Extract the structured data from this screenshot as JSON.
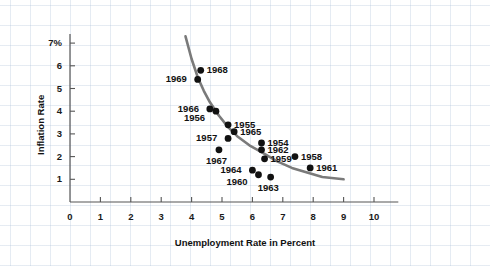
{
  "chart_data": {
    "type": "scatter",
    "title": "",
    "xlabel": "Unemployment Rate in Percent",
    "ylabel": "Inflation Rate",
    "xlim": [
      0,
      10.8
    ],
    "ylim": [
      0,
      7.4
    ],
    "grid": true,
    "legend": null,
    "xticks": [
      "0",
      "1",
      "2",
      "3",
      "4",
      "5",
      "6",
      "7",
      "8",
      "9",
      "10"
    ],
    "xtick_values": [
      0,
      1,
      2,
      3,
      4,
      5,
      6,
      7,
      8,
      9,
      10
    ],
    "yticks": [
      "1",
      "2",
      "3",
      "4",
      "5",
      "6",
      "7%"
    ],
    "ytick_values": [
      1,
      2,
      3,
      4,
      5,
      6,
      7
    ],
    "origin_label": "0",
    "point_color": "#111111",
    "curve_color": "#7a7a7a",
    "points": [
      {
        "label": "1968",
        "x": 4.3,
        "y": 5.8,
        "label_pos": "right"
      },
      {
        "label": "1969",
        "x": 4.2,
        "y": 5.4,
        "label_pos": "left"
      },
      {
        "label": "1966",
        "x": 4.6,
        "y": 4.1,
        "label_pos": "left"
      },
      {
        "label": "1956",
        "x": 4.8,
        "y": 4.0,
        "label_pos": "left-below"
      },
      {
        "label": "1955",
        "x": 5.2,
        "y": 3.4,
        "label_pos": "right"
      },
      {
        "label": "1965",
        "x": 5.4,
        "y": 3.1,
        "label_pos": "right"
      },
      {
        "label": "1957",
        "x": 5.2,
        "y": 2.8,
        "label_pos": "left"
      },
      {
        "label": "1967",
        "x": 4.9,
        "y": 2.3,
        "label_pos": "below"
      },
      {
        "label": "1954",
        "x": 6.3,
        "y": 2.6,
        "label_pos": "right"
      },
      {
        "label": "1962",
        "x": 6.3,
        "y": 2.3,
        "label_pos": "right"
      },
      {
        "label": "1959",
        "x": 6.4,
        "y": 1.9,
        "label_pos": "right"
      },
      {
        "label": "1958",
        "x": 7.4,
        "y": 2.0,
        "label_pos": "right"
      },
      {
        "label": "1961",
        "x": 7.9,
        "y": 1.5,
        "label_pos": "right"
      },
      {
        "label": "1964",
        "x": 6.0,
        "y": 1.4,
        "label_pos": "left"
      },
      {
        "label": "1960",
        "x": 6.2,
        "y": 1.2,
        "label_pos": "left-below"
      },
      {
        "label": "1963",
        "x": 6.6,
        "y": 1.1,
        "label_pos": "below"
      }
    ],
    "curve": {
      "description": "fitted Phillips curve, downward sloping convex",
      "points": [
        [
          3.8,
          7.3
        ],
        [
          4.0,
          6.3
        ],
        [
          4.2,
          5.5
        ],
        [
          4.4,
          4.9
        ],
        [
          4.6,
          4.4
        ],
        [
          4.9,
          3.8
        ],
        [
          5.2,
          3.3
        ],
        [
          5.5,
          2.9
        ],
        [
          5.9,
          2.5
        ],
        [
          6.3,
          2.2
        ],
        [
          6.8,
          1.8
        ],
        [
          7.3,
          1.5
        ],
        [
          7.8,
          1.3
        ],
        [
          8.3,
          1.1
        ],
        [
          9.0,
          1.0
        ]
      ]
    }
  }
}
